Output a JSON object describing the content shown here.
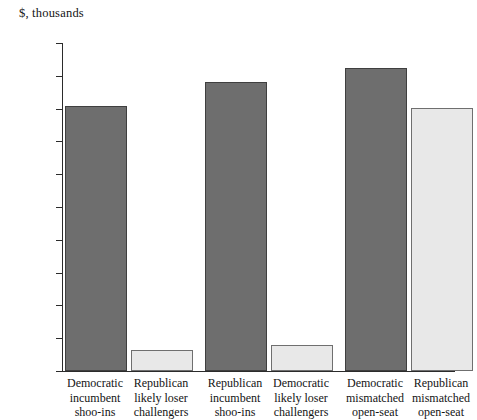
{
  "chart_data": {
    "type": "bar",
    "title": "$, thousands",
    "xlabel": "",
    "ylabel": "",
    "ylim": [
      0,
      1000
    ],
    "yticks": [
      0,
      100,
      200,
      300,
      400,
      500,
      600,
      700,
      800,
      900,
      1000
    ],
    "grid": false,
    "legend": "none",
    "categories": [
      "Democratic incumbent shoo-ins",
      "Republican likely loser challengers",
      "Republican incumbent shoo-ins",
      "Democratic likely loser challengers",
      "Democratic mismatched open-seat",
      "Republican mismatched open-seat"
    ],
    "category_lines": [
      [
        "Democratic",
        "incumbent",
        "shoo-ins"
      ],
      [
        "Republican",
        "likely loser",
        "challengers"
      ],
      [
        "Republican",
        "incumbent",
        "shoo-ins"
      ],
      [
        "Democratic",
        "likely loser",
        "challengers"
      ],
      [
        "Democratic",
        "mismatched",
        "open-seat"
      ],
      [
        "Republican",
        "mismatched",
        "open-seat"
      ]
    ],
    "values": [
      808,
      65,
      880,
      78,
      925,
      803
    ],
    "bar_styles": [
      "dark",
      "light",
      "dark",
      "light",
      "dark",
      "light"
    ],
    "colors": {
      "dark_fill": "#6e6e6e",
      "light_fill": "#e8e8e8",
      "dark_edge": "#3f3f3f",
      "light_edge": "#6f6f6f",
      "axis": "#2b2b2b",
      "text": "#141414",
      "background": "#ffffff"
    }
  },
  "ticks": {
    "t0": "0",
    "t100": "100",
    "t200": "200",
    "t300": "300",
    "t400": "400",
    "t500": "500",
    "t600": "600",
    "t700": "700",
    "t800": "800",
    "t900": "900",
    "t1000": "1000"
  }
}
